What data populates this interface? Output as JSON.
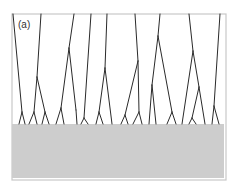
{
  "figure": {
    "panel_label": "(a)",
    "colors": {
      "frame": "#c8c8c8",
      "background": "#ffffff",
      "substrate": "#cdcdcd",
      "branch_lines": "#2a2a2a"
    },
    "frame": {
      "x": 12,
      "y": 14,
      "width": 214,
      "height": 166
    },
    "substrate": {
      "x": 12,
      "y": 124,
      "width": 212,
      "height": 54
    },
    "branches": [
      {
        "name": "tree-1",
        "segments": [
          [
            13,
            14,
            22,
            112
          ],
          [
            22,
            112,
            19,
            124
          ],
          [
            22,
            112,
            25,
            124
          ]
        ]
      },
      {
        "name": "tree-2",
        "segments": [
          [
            41,
            14,
            37,
            77
          ],
          [
            37,
            77,
            34,
            112
          ],
          [
            34,
            112,
            29,
            124
          ],
          [
            34,
            112,
            37,
            124
          ],
          [
            37,
            77,
            45,
            112
          ],
          [
            45,
            112,
            42,
            124
          ],
          [
            45,
            112,
            49,
            124
          ]
        ]
      },
      {
        "name": "tree-3",
        "segments": [
          [
            74,
            14,
            69,
            48
          ],
          [
            69,
            48,
            61,
            108
          ],
          [
            61,
            108,
            56,
            124
          ],
          [
            61,
            108,
            64,
            124
          ],
          [
            69,
            48,
            76,
            110
          ],
          [
            76,
            110,
            77,
            124
          ]
        ]
      },
      {
        "name": "tree-4",
        "segments": [
          [
            91,
            14,
            84,
            118
          ],
          [
            84,
            118,
            81,
            124
          ],
          [
            84,
            118,
            88,
            124
          ]
        ]
      },
      {
        "name": "tree-5",
        "segments": [
          [
            107,
            14,
            105,
            68
          ],
          [
            105,
            68,
            99,
            112
          ],
          [
            99,
            112,
            96,
            124
          ],
          [
            99,
            112,
            103,
            124
          ],
          [
            105,
            68,
            112,
            124
          ]
        ]
      },
      {
        "name": "tree-6",
        "segments": [
          [
            135,
            14,
            138,
            61
          ],
          [
            138,
            61,
            125,
            115
          ],
          [
            125,
            115,
            121,
            124
          ],
          [
            125,
            115,
            128,
            124
          ],
          [
            138,
            61,
            139,
            112
          ],
          [
            139,
            112,
            133,
            124
          ],
          [
            139,
            112,
            142,
            124
          ]
        ]
      },
      {
        "name": "tree-7",
        "segments": [
          [
            160,
            14,
            158,
            36
          ],
          [
            158,
            36,
            152,
            85
          ],
          [
            152,
            85,
            149,
            124
          ],
          [
            152,
            85,
            156,
            124
          ],
          [
            158,
            36,
            172,
            112
          ],
          [
            172,
            112,
            167,
            124
          ],
          [
            172,
            112,
            176,
            124
          ]
        ]
      },
      {
        "name": "tree-8",
        "segments": [
          [
            189,
            14,
            193,
            51
          ],
          [
            193,
            51,
            182,
            124
          ],
          [
            193,
            51,
            199,
            87
          ],
          [
            199,
            87,
            192,
            118
          ],
          [
            192,
            118,
            189,
            124
          ],
          [
            192,
            118,
            196,
            124
          ],
          [
            199,
            87,
            205,
            124
          ]
        ]
      },
      {
        "name": "tree-9",
        "segments": [
          [
            220,
            14,
            214,
            106
          ],
          [
            214,
            106,
            212,
            124
          ],
          [
            214,
            106,
            219,
            124
          ]
        ]
      }
    ]
  }
}
